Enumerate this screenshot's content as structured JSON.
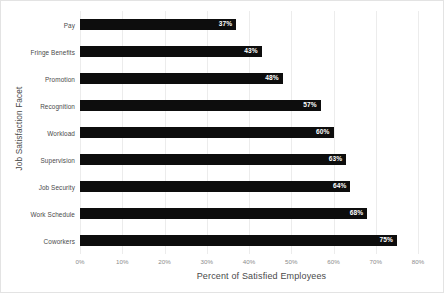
{
  "chart_data": {
    "type": "bar",
    "orientation": "horizontal",
    "title": "",
    "xlabel": "Percent of Satisfied Employees",
    "ylabel": "Job Satisfaction Facet",
    "categories": [
      "Pay",
      "Fringe Benefits",
      "Promotion",
      "Recognition",
      "Workload",
      "Supervision",
      "Job Security",
      "Work Schedule",
      "Coworkers"
    ],
    "values": [
      37,
      43,
      48,
      57,
      60,
      63,
      64,
      68,
      75
    ],
    "data_labels": [
      "37%",
      "43%",
      "48%",
      "57%",
      "60%",
      "63%",
      "64%",
      "68%",
      "75%"
    ],
    "xlim": [
      0,
      80
    ],
    "xticks": [
      0,
      10,
      20,
      30,
      40,
      50,
      60,
      70,
      80
    ],
    "xtick_labels": [
      "0%",
      "10%",
      "20%",
      "30%",
      "40%",
      "50%",
      "60%",
      "70%",
      "80%"
    ],
    "grid": "vertical",
    "legend": "none",
    "bar_color": "#0d0d0d",
    "label_color": "#ffffff",
    "gridline_color": "#ececec"
  }
}
